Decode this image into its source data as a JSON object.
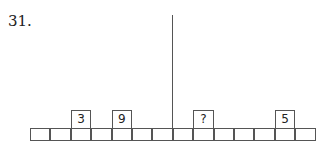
{
  "question_number": "31.",
  "row": {
    "cell_count": 14,
    "divider_after_cell": 7,
    "raised_boxes": [
      {
        "cell_index": 2,
        "label": "3"
      },
      {
        "cell_index": 4,
        "label": "9"
      },
      {
        "cell_index": 8,
        "label": "?"
      },
      {
        "cell_index": 12,
        "label": "5"
      }
    ]
  }
}
